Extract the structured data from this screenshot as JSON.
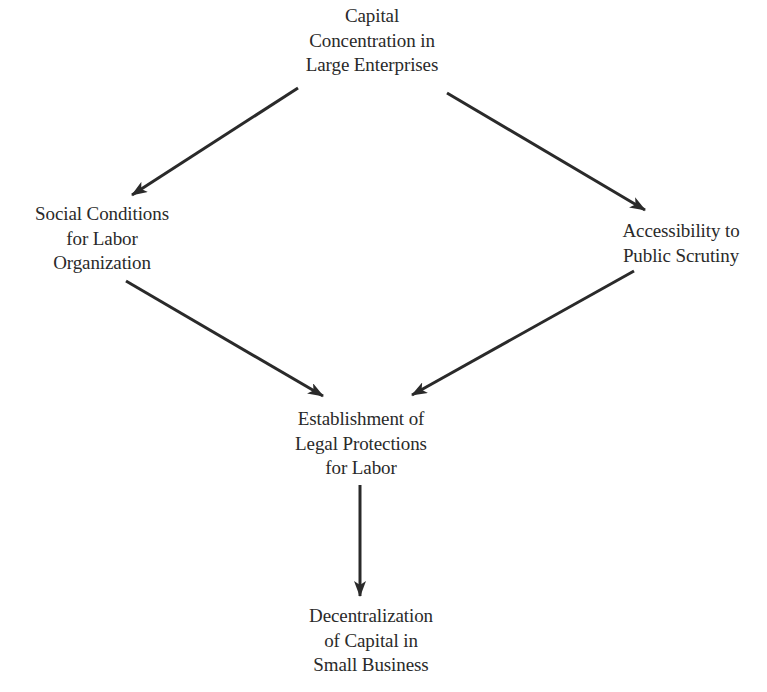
{
  "diagram": {
    "type": "flow",
    "nodes": [
      {
        "id": "capital-concentration",
        "lines": [
          "Capital",
          "Concentration in",
          "Large Enterprises"
        ]
      },
      {
        "id": "social-conditions",
        "lines": [
          "Social Conditions",
          "for Labor",
          "Organization"
        ]
      },
      {
        "id": "public-scrutiny",
        "lines": [
          "Accessibility to",
          "Public Scrutiny"
        ]
      },
      {
        "id": "legal-protections",
        "lines": [
          "Establishment of",
          "Legal Protections",
          "for Labor"
        ]
      },
      {
        "id": "decentralization",
        "lines": [
          "Decentralization",
          "of Capital in",
          "Small Business"
        ]
      }
    ],
    "edges": [
      {
        "from": "capital-concentration",
        "to": "social-conditions"
      },
      {
        "from": "capital-concentration",
        "to": "public-scrutiny"
      },
      {
        "from": "social-conditions",
        "to": "legal-protections"
      },
      {
        "from": "public-scrutiny",
        "to": "legal-protections"
      },
      {
        "from": "legal-protections",
        "to": "decentralization"
      }
    ],
    "colors": {
      "background": "#ffffff",
      "ink": "#2a2a2a"
    }
  }
}
